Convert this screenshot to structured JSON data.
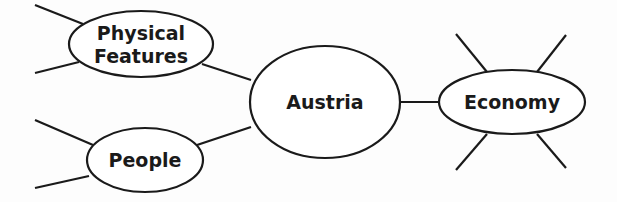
{
  "diagram": {
    "type": "concept-map",
    "stroke_color": "#1a1a1a",
    "fill_color": "#ffffff",
    "nodes": [
      {
        "id": "austria",
        "label_lines": [
          "Austria"
        ],
        "cx": 325,
        "cy": 102,
        "rx": 75,
        "ry": 56
      },
      {
        "id": "physical-features",
        "label_lines": [
          "Physical",
          "Features"
        ],
        "cx": 141,
        "cy": 44,
        "rx": 72,
        "ry": 33
      },
      {
        "id": "people",
        "label_lines": [
          "People"
        ],
        "cx": 145,
        "cy": 160,
        "rx": 58,
        "ry": 32
      },
      {
        "id": "economy",
        "label_lines": [
          "Economy"
        ],
        "cx": 512,
        "cy": 102,
        "rx": 73,
        "ry": 32
      }
    ],
    "edges": [
      {
        "from": "physical-features",
        "to": "austria",
        "x1": 202,
        "y1": 64,
        "x2": 251,
        "y2": 80
      },
      {
        "from": "people",
        "to": "austria",
        "x1": 197,
        "y1": 145,
        "x2": 251,
        "y2": 127
      },
      {
        "from": "austria",
        "to": "economy",
        "x1": 400,
        "y1": 102,
        "x2": 440,
        "y2": 102
      }
    ],
    "blank_branches": [
      {
        "node": "physical-features",
        "x1": 35,
        "y1": 5,
        "x2": 83,
        "y2": 24
      },
      {
        "node": "physical-features",
        "x1": 35,
        "y1": 73,
        "x2": 79,
        "y2": 62
      },
      {
        "node": "people",
        "x1": 35,
        "y1": 120,
        "x2": 93,
        "y2": 145
      },
      {
        "node": "people",
        "x1": 35,
        "y1": 188,
        "x2": 89,
        "y2": 176
      },
      {
        "node": "economy",
        "x1": 456,
        "y1": 34,
        "x2": 487,
        "y2": 72
      },
      {
        "node": "economy",
        "x1": 566,
        "y1": 35,
        "x2": 537,
        "y2": 72
      },
      {
        "node": "economy",
        "x1": 456,
        "y1": 170,
        "x2": 487,
        "y2": 134
      },
      {
        "node": "economy",
        "x1": 566,
        "y1": 168,
        "x2": 537,
        "y2": 134
      }
    ]
  }
}
